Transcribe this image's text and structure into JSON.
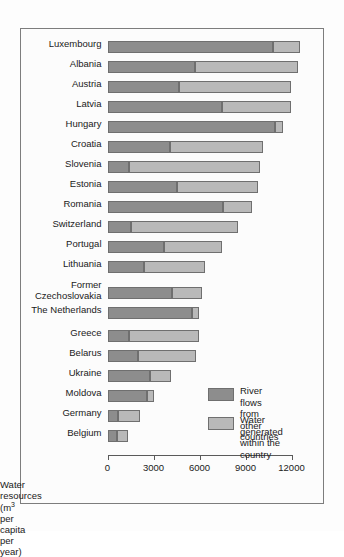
{
  "chart_data": {
    "type": "bar",
    "orientation": "horizontal",
    "stacked": true,
    "title": "",
    "xlabel": "Water resources (m3 per capita per year)",
    "xlabel_parts": {
      "before": "Water resources (m",
      "exponent": "3",
      "after": " per capita per year)"
    },
    "ylabel": "",
    "xlim": [
      0,
      13000
    ],
    "axis_max_drawn": 12000,
    "grid": false,
    "ticks": [
      0,
      3000,
      6000,
      9000,
      12000
    ],
    "tick_labels": [
      "0",
      "3000",
      "6000",
      "9000",
      "12000"
    ],
    "legend_position": "inside-bottom-right",
    "categories": [
      "Luxembourg",
      "Albania",
      "Austria",
      "Latvia",
      "Hungary",
      "Croatia",
      "Slovenia",
      "Estonia",
      "Romania",
      "Switzerland",
      "Portugal",
      "Lithuania",
      "Former\nCzechoslovakia",
      "The Netherlands",
      "Greece",
      "Belarus",
      "Ukraine",
      "Moldova",
      "Germany",
      "Belgium"
    ],
    "series": [
      {
        "name": "River flows from other countries",
        "color": "#8d8d8d",
        "values": [
          10800,
          5700,
          4650,
          7450,
          10950,
          4100,
          1400,
          4500,
          7500,
          1500,
          3700,
          2400,
          4200,
          5500,
          1400,
          2000,
          2750,
          2550,
          700,
          650
        ]
      },
      {
        "name": "Water generated within the country",
        "color": "#b9b9b9",
        "values": [
          1750,
          6700,
          7350,
          4550,
          500,
          6050,
          8550,
          5300,
          1900,
          7000,
          3750,
          3950,
          1950,
          500,
          4600,
          3750,
          1400,
          500,
          1400,
          700
        ]
      }
    ],
    "totals": [
      12550,
      12400,
      12000,
      12000,
      11450,
      10150,
      9950,
      9800,
      9400,
      8500,
      7450,
      6350,
      6150,
      6000,
      6000,
      5750,
      4150,
      3050,
      2100,
      1350
    ]
  },
  "legend": {
    "entries": [
      {
        "label": "River flows from\nother countries",
        "color": "#8d8d8d",
        "swatch_name": "legend-swatch-river-flows"
      },
      {
        "label": "Water generated\nwithin the country",
        "color": "#b9b9b9",
        "swatch_name": "legend-swatch-water-generated"
      }
    ]
  }
}
